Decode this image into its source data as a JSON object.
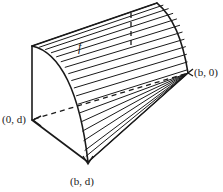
{
  "figure": {
    "name": "solid-under-cylindrical-surface",
    "stroke_color": "#1a1a1a",
    "fill_color": "#ffffff",
    "background_color": "#ffffff",
    "labels": {
      "origin_depth": {
        "text": "(0, d)",
        "parts": {
          "open": "(0, ",
          "var": "d",
          "close": ")"
        }
      },
      "base_far": {
        "text": "(b, d)",
        "parts": {
          "open": "(",
          "var1": "b",
          "mid": ", ",
          "var2": "d",
          "close": ")"
        }
      },
      "base_near": {
        "text": "(b, 0)",
        "parts": {
          "open": "(",
          "var1": "b",
          "mid": ", 0)"
        }
      },
      "surface": {
        "text": "f"
      }
    },
    "geometry": {
      "ruling_count": 22,
      "dashed_hidden_edges": 2,
      "vertices": {
        "top_left": [
          32,
          46
        ],
        "bottom_left": [
          32,
          120
        ],
        "base_far_corner": [
          88,
          162
        ],
        "base_near_corner": [
          188,
          73
        ],
        "curve_apex": [
          157,
          3
        ]
      }
    }
  }
}
